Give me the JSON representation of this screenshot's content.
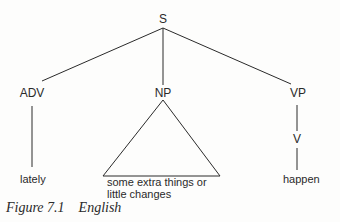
{
  "tree": {
    "root": "S",
    "children": [
      {
        "label": "ADV",
        "leaf": "lately"
      },
      {
        "label": "NP",
        "leaf_line1": "some extra things or",
        "leaf_line2": "little changes",
        "shape": "triangle"
      },
      {
        "label": "VP",
        "child": "V",
        "leaf": "happen"
      }
    ]
  },
  "caption": "Figure 7.1    English"
}
